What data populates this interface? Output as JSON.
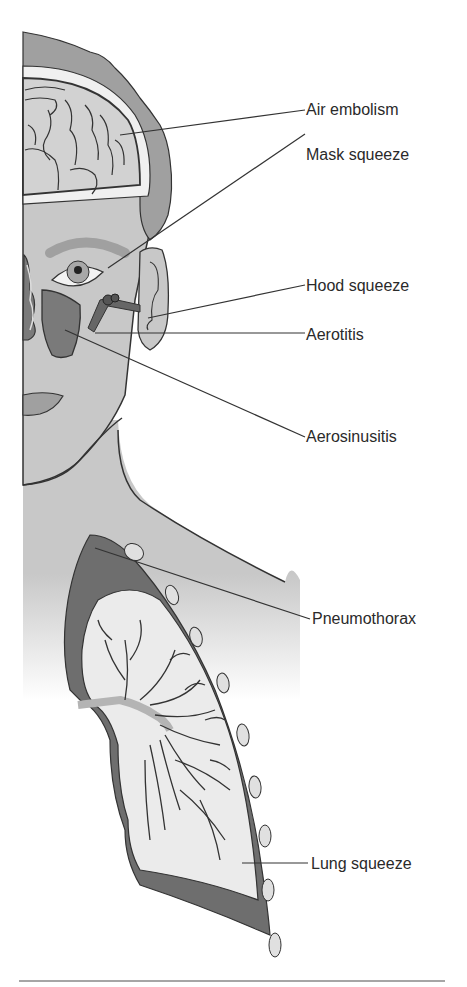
{
  "figure": {
    "type": "anatomical-diagram",
    "labels": [
      {
        "id": "air-embolism",
        "text": "Air embolism",
        "x": 306,
        "y": 72
      },
      {
        "id": "mask-squeeze",
        "text": "Mask squeeze",
        "x": 306,
        "y": 118
      },
      {
        "id": "hood-squeeze",
        "text": "Hood squeeze",
        "x": 306,
        "y": 276
      },
      {
        "id": "aerotitis",
        "text": "Aerotitis",
        "x": 306,
        "y": 326
      },
      {
        "id": "aerosinusitis",
        "text": "Aerosinusitis",
        "x": 306,
        "y": 428
      },
      {
        "id": "pneumothorax",
        "text": "Pneumothorax",
        "x": 312,
        "y": 610
      },
      {
        "id": "lung-squeeze",
        "text": "Lung squeeze",
        "x": 311,
        "y": 856
      }
    ],
    "colors": {
      "skin": "#c8c8c8",
      "hair": "#a0a0a0",
      "brain": "#d2d2d2",
      "sinus": "#7a7a7a",
      "pleura": "#6e6e6e",
      "lung": "#ebebeb",
      "bronchi": "#b4b4b4",
      "outline": "#333333",
      "text": "#2a2a2a"
    }
  }
}
